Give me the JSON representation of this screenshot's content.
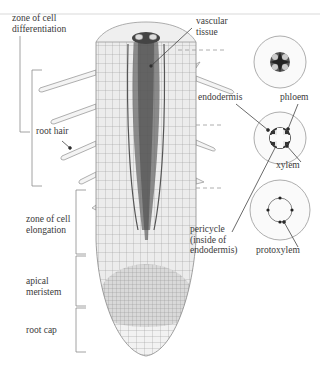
{
  "figure": {
    "colors": {
      "background": "#ffffff",
      "line": "#8a8a8a",
      "text": "#3a3a3a",
      "vascular": "#555555",
      "tissue_fill": "#e6e6e6",
      "cap_fill": "#efefef"
    }
  },
  "labels": {
    "zone_differentiation": "zone of cell\ndifferentiation",
    "root_hair": "root hair",
    "zone_elongation": "zone of cell\nelongation",
    "apical_meristem": "apical\nmeristem",
    "root_cap": "root cap",
    "vascular_tissue": "vascular\ntissue",
    "endodermis": "endodermis",
    "phloem": "phloem",
    "xylem": "xylem",
    "pericycle": "pericycle\n(inside of\nendodermis)",
    "protoxylem": "protoxylem"
  },
  "cross_sections": [
    {
      "name": "upper-section",
      "cx": 280,
      "cy": 62,
      "r": 26
    },
    {
      "name": "middle-section",
      "cx": 280,
      "cy": 138,
      "r": 26
    },
    {
      "name": "lower-section",
      "cx": 280,
      "cy": 210,
      "r": 30
    }
  ]
}
